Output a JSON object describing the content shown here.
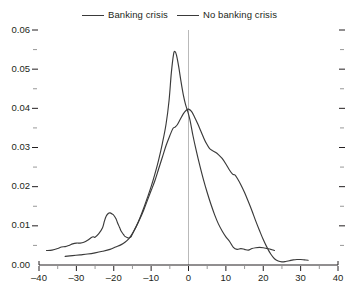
{
  "chart_data": {
    "type": "line",
    "title": "",
    "xlabel": "",
    "ylabel": "",
    "xlim": [
      -40,
      40
    ],
    "ylim": [
      0,
      0.06
    ],
    "grid": false,
    "legend_position": "top-center",
    "annotations": [
      {
        "name": "zero-reference-line",
        "type": "vline",
        "x": 0,
        "color": "#b9b9b9"
      }
    ],
    "x_ticks": [
      {
        "value": -40,
        "label": "–40"
      },
      {
        "value": -30,
        "label": "–30"
      },
      {
        "value": -20,
        "label": "–20"
      },
      {
        "value": -10,
        "label": "–10"
      },
      {
        "value": 0,
        "label": "0"
      },
      {
        "value": 10,
        "label": "10"
      },
      {
        "value": 20,
        "label": "20"
      },
      {
        "value": 30,
        "label": "30"
      },
      {
        "value": 40,
        "label": "40"
      }
    ],
    "x_minor_ticks": [
      -35,
      -25,
      -15,
      -5,
      5,
      15,
      25,
      35
    ],
    "y_ticks": [
      {
        "value": 0.0,
        "label": "0.00"
      },
      {
        "value": 0.01,
        "label": "0.01"
      },
      {
        "value": 0.02,
        "label": "0.02"
      },
      {
        "value": 0.03,
        "label": "0.03"
      },
      {
        "value": 0.04,
        "label": "0.04"
      },
      {
        "value": 0.05,
        "label": "0.05"
      },
      {
        "value": 0.06,
        "label": "0.06"
      }
    ],
    "y_minor_ticks": [
      0.005,
      0.015,
      0.025,
      0.035,
      0.045,
      0.055
    ],
    "series_color": "#3a3a3a",
    "series": [
      {
        "name": "Banking crisis",
        "points": [
          [
            -33.0,
            0.0022
          ],
          [
            -31.0,
            0.0024
          ],
          [
            -29.0,
            0.0026
          ],
          [
            -27.0,
            0.0028
          ],
          [
            -25.0,
            0.0031
          ],
          [
            -23.0,
            0.0035
          ],
          [
            -21.0,
            0.004
          ],
          [
            -19.5,
            0.0046
          ],
          [
            -18.0,
            0.0052
          ],
          [
            -17.0,
            0.0058
          ],
          [
            -16.0,
            0.0067
          ],
          [
            -15.0,
            0.008
          ],
          [
            -14.0,
            0.0098
          ],
          [
            -13.0,
            0.012
          ],
          [
            -12.0,
            0.0145
          ],
          [
            -11.0,
            0.0172
          ],
          [
            -10.0,
            0.02
          ],
          [
            -9.0,
            0.0232
          ],
          [
            -8.0,
            0.0268
          ],
          [
            -7.0,
            0.031
          ],
          [
            -6.0,
            0.036
          ],
          [
            -5.2,
            0.042
          ],
          [
            -4.6,
            0.049
          ],
          [
            -4.0,
            0.0538
          ],
          [
            -3.6,
            0.0545
          ],
          [
            -3.2,
            0.0535
          ],
          [
            -2.6,
            0.0505
          ],
          [
            -2.0,
            0.0468
          ],
          [
            -1.4,
            0.0435
          ],
          [
            -0.8,
            0.041
          ],
          [
            -0.2,
            0.0392
          ],
          [
            0.4,
            0.037
          ],
          [
            1.2,
            0.033
          ],
          [
            2.0,
            0.0295
          ],
          [
            3.0,
            0.0255
          ],
          [
            4.0,
            0.0218
          ],
          [
            5.0,
            0.0185
          ],
          [
            6.0,
            0.0155
          ],
          [
            7.0,
            0.0128
          ],
          [
            8.0,
            0.0105
          ],
          [
            9.0,
            0.0087
          ],
          [
            10.0,
            0.0072
          ],
          [
            11.0,
            0.006
          ],
          [
            12.0,
            0.0045
          ],
          [
            13.0,
            0.004
          ],
          [
            14.0,
            0.0042
          ],
          [
            15.0,
            0.004
          ],
          [
            16.0,
            0.0038
          ],
          [
            17.0,
            0.0042
          ],
          [
            18.0,
            0.0044
          ],
          [
            19.0,
            0.0045
          ],
          [
            20.0,
            0.0044
          ],
          [
            21.0,
            0.0042
          ],
          [
            22.0,
            0.004
          ],
          [
            23.0,
            0.0037
          ]
        ]
      },
      {
        "name": "No banking crisis",
        "points": [
          [
            -38.0,
            0.0037
          ],
          [
            -36.5,
            0.0038
          ],
          [
            -35.0,
            0.0042
          ],
          [
            -34.0,
            0.0046
          ],
          [
            -33.0,
            0.0047
          ],
          [
            -32.0,
            0.005
          ],
          [
            -31.0,
            0.0054
          ],
          [
            -30.0,
            0.0056
          ],
          [
            -29.0,
            0.0056
          ],
          [
            -28.0,
            0.0058
          ],
          [
            -27.0,
            0.0063
          ],
          [
            -26.0,
            0.007
          ],
          [
            -25.5,
            0.0072
          ],
          [
            -25.0,
            0.0071
          ],
          [
            -24.0,
            0.008
          ],
          [
            -23.0,
            0.0095
          ],
          [
            -22.5,
            0.0112
          ],
          [
            -22.0,
            0.0125
          ],
          [
            -21.4,
            0.0132
          ],
          [
            -21.0,
            0.0133
          ],
          [
            -20.4,
            0.013
          ],
          [
            -20.0,
            0.0127
          ],
          [
            -19.4,
            0.0118
          ],
          [
            -19.0,
            0.0108
          ],
          [
            -18.4,
            0.0095
          ],
          [
            -18.0,
            0.0086
          ],
          [
            -17.4,
            0.0078
          ],
          [
            -17.0,
            0.0073
          ],
          [
            -16.4,
            0.007
          ],
          [
            -16.0,
            0.0069
          ],
          [
            -15.4,
            0.0072
          ],
          [
            -15.0,
            0.008
          ],
          [
            -14.0,
            0.0098
          ],
          [
            -13.0,
            0.0118
          ],
          [
            -12.0,
            0.014
          ],
          [
            -11.0,
            0.0165
          ],
          [
            -10.0,
            0.019
          ],
          [
            -9.0,
            0.0215
          ],
          [
            -8.0,
            0.0245
          ],
          [
            -7.0,
            0.0275
          ],
          [
            -6.0,
            0.0305
          ],
          [
            -5.0,
            0.033
          ],
          [
            -4.2,
            0.0348
          ],
          [
            -3.6,
            0.0352
          ],
          [
            -3.0,
            0.0358
          ],
          [
            -2.2,
            0.0372
          ],
          [
            -1.4,
            0.0386
          ],
          [
            -0.6,
            0.0395
          ],
          [
            0.0,
            0.0398
          ],
          [
            0.8,
            0.0392
          ],
          [
            1.6,
            0.0378
          ],
          [
            2.4,
            0.0362
          ],
          [
            3.2,
            0.0344
          ],
          [
            4.0,
            0.0326
          ],
          [
            4.8,
            0.031
          ],
          [
            5.6,
            0.0298
          ],
          [
            6.4,
            0.0292
          ],
          [
            7.2,
            0.0288
          ],
          [
            8.0,
            0.0282
          ],
          [
            9.0,
            0.0272
          ],
          [
            10.0,
            0.0258
          ],
          [
            11.0,
            0.0242
          ],
          [
            11.8,
            0.0232
          ],
          [
            12.4,
            0.023
          ],
          [
            13.0,
            0.0222
          ],
          [
            14.0,
            0.0205
          ],
          [
            15.0,
            0.0185
          ],
          [
            16.0,
            0.0162
          ],
          [
            17.0,
            0.0138
          ],
          [
            18.0,
            0.0112
          ],
          [
            19.0,
            0.0088
          ],
          [
            20.0,
            0.0065
          ],
          [
            21.0,
            0.0045
          ],
          [
            22.0,
            0.0028
          ],
          [
            23.0,
            0.0016
          ],
          [
            24.0,
            0.001
          ],
          [
            25.0,
            0.0008
          ],
          [
            26.0,
            0.0009
          ],
          [
            27.0,
            0.0011
          ],
          [
            28.0,
            0.0013
          ],
          [
            29.0,
            0.0014
          ],
          [
            30.0,
            0.0014
          ],
          [
            31.0,
            0.0013
          ],
          [
            32.0,
            0.0012
          ]
        ]
      }
    ]
  },
  "legend": {
    "entries": [
      {
        "label": "Banking crisis"
      },
      {
        "label": "No banking crisis"
      }
    ]
  }
}
